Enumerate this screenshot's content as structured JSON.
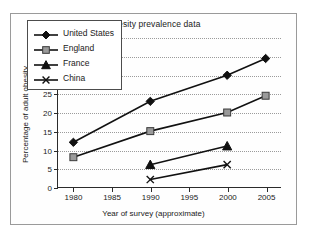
{
  "chart_data": {
    "type": "line",
    "title": "Obesity prevalence data",
    "xlabel": "Year of survey (approximate)",
    "ylabel": "Percentage of adult obesity",
    "xlim": [
      1978,
      2007
    ],
    "ylim": [
      0,
      40
    ],
    "xticks": [
      1980,
      1985,
      1990,
      1995,
      2000,
      2005
    ],
    "yticks": [
      0,
      5,
      10,
      15,
      20,
      25,
      30,
      35,
      40
    ],
    "grid": "horizontal-dotted",
    "legend_position": "upper-left-inside",
    "series": [
      {
        "name": "United States",
        "marker": "diamond",
        "marker_color": "#111111",
        "line_color": "#111111",
        "x": [
          1980,
          1990,
          2000,
          2005
        ],
        "values": [
          12,
          23,
          30,
          34.5
        ]
      },
      {
        "name": "England",
        "marker": "square",
        "marker_color": "#9a9a9a",
        "line_color": "#111111",
        "x": [
          1980,
          1990,
          2000,
          2005
        ],
        "values": [
          8,
          15,
          20,
          24.5
        ]
      },
      {
        "name": "France",
        "marker": "triangle",
        "marker_color": "#111111",
        "line_color": "#111111",
        "x": [
          1990,
          2000
        ],
        "values": [
          6,
          11
        ]
      },
      {
        "name": "China",
        "marker": "x",
        "marker_color": "#111111",
        "line_color": "#111111",
        "x": [
          1990,
          2000
        ],
        "values": [
          2,
          6
        ]
      }
    ]
  }
}
